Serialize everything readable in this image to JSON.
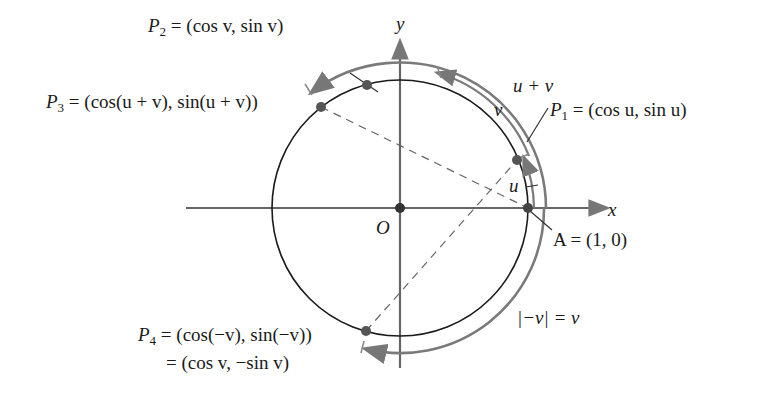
{
  "figure": {
    "colors": {
      "circle": "#1a1a1a",
      "axis": "#555555",
      "arc": "#7a7a7a",
      "point": "#555555",
      "dash": "#666666"
    }
  },
  "axes": {
    "x_label": "x",
    "y_label": "y",
    "origin_label": "O"
  },
  "points": {
    "P1": {
      "name": "P",
      "sub": "1",
      "expr": " = (cos u, sin u)"
    },
    "P2": {
      "name": "P",
      "sub": "2",
      "expr": " = (cos v,  sin v)"
    },
    "P3": {
      "name": "P",
      "sub": "3",
      "expr": " = (cos(u + v), sin(u + v))"
    },
    "P4": {
      "name": "P",
      "sub": "4",
      "expr": " = (cos(−v), sin(−v))",
      "expr2": "= (cos v, −sin v)"
    },
    "A": {
      "expr": "A = (1, 0)"
    }
  },
  "arcs": {
    "u": "u",
    "v": "v",
    "u_plus_v": "u + v",
    "neg_v": "|−v| = v"
  }
}
